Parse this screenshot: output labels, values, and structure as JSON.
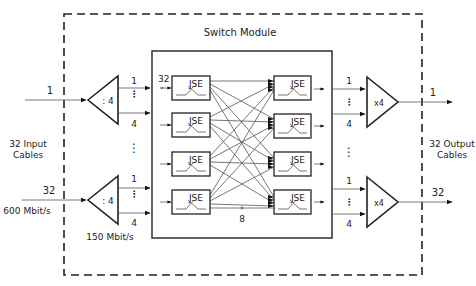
{
  "module": {
    "title": "Switch Module"
  },
  "input": {
    "label_line1": "32 Input",
    "label_line2": "Cables",
    "top_index": "1",
    "bottom_index": "32",
    "rate": "600 Mbit/s"
  },
  "demux": {
    "ratio": ": 4",
    "out_first": "1",
    "out_last": "4",
    "rate": "150 Mbit/s"
  },
  "mux": {
    "ratio": "x4",
    "in_first": "1",
    "in_last": "4"
  },
  "output": {
    "label_line1": "32 Output",
    "label_line2": "Cables",
    "top_index": "1",
    "bottom_index": "32"
  },
  "switch_fabric": {
    "element_label": "JSE",
    "inputs_per_element": "32",
    "links_per_element": "8",
    "left_elements": [
      "JSE",
      "JSE",
      "JSE",
      "JSE"
    ],
    "right_elements": [
      "JSE",
      "JSE",
      "JSE",
      "JSE"
    ]
  },
  "colors": {
    "line": "#222222",
    "wire": "#555555",
    "background": "#ffffff"
  }
}
